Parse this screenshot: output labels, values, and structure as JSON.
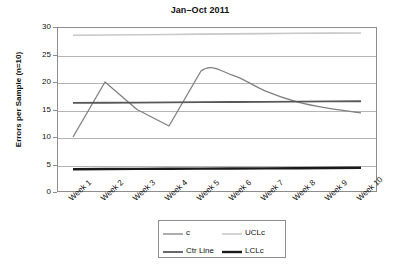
{
  "chart_data": {
    "type": "line",
    "title": "Jan–Oct 2011",
    "xlabel": "",
    "ylabel": "Errors per Sample (n=10)",
    "categories": [
      "Week 1",
      "Week 2",
      "Week 3",
      "Week 4",
      "Week 5",
      "Week 6",
      "Week 7",
      "Week 8",
      "Week 9",
      "Week 10"
    ],
    "ylim": [
      0,
      30
    ],
    "y_ticks": [
      0,
      5,
      10,
      15,
      20,
      25,
      30
    ],
    "grid": true,
    "legend_position": "bottom",
    "series": [
      {
        "name": "c",
        "type": "data",
        "color": "#808080",
        "values": [
          10,
          20,
          15,
          12,
          22,
          21.2,
          18.4,
          16.4,
          15.2,
          14.4
        ]
      },
      {
        "name": "UCLc",
        "type": "constant",
        "color": "#c8c8c8",
        "value": 28.7,
        "values": [
          28.5,
          28.55,
          28.6,
          28.65,
          28.7,
          28.75,
          28.8,
          28.85,
          28.88,
          28.9
        ]
      },
      {
        "name": "Ctr Line",
        "type": "constant",
        "color": "#585858",
        "value": 16.4,
        "values": [
          16.2,
          16.23,
          16.26,
          16.3,
          16.33,
          16.36,
          16.4,
          16.44,
          16.47,
          16.5
        ]
      },
      {
        "name": "LCLc",
        "type": "constant",
        "color": "#1a1a1a",
        "value": 4.3,
        "values": [
          4.15,
          4.17,
          4.2,
          4.22,
          4.25,
          4.28,
          4.3,
          4.33,
          4.36,
          4.4
        ]
      }
    ]
  },
  "legend": {
    "items": [
      {
        "label": "c",
        "color": "#808080",
        "width": 1.3
      },
      {
        "label": "UCLc",
        "color": "#c8c8c8",
        "width": 1.6
      },
      {
        "label": "Ctr Line",
        "color": "#585858",
        "width": 1.8
      },
      {
        "label": "LCLc",
        "color": "#1a1a1a",
        "width": 2.4
      }
    ]
  },
  "colors": {
    "frame": "#8d8d8d",
    "grid": "#b4b4b4",
    "text": "#111111",
    "background": "#ffffff"
  }
}
